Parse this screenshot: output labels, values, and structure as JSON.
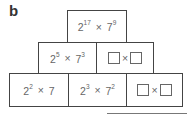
{
  "label": "b",
  "pyramid": {
    "top": {
      "base1": "2",
      "exp1": "17",
      "op": "×",
      "base2": "7",
      "exp2": "9"
    },
    "middle": [
      {
        "base1": "2",
        "exp1": "5",
        "op": "×",
        "base2": "7",
        "exp2": "3"
      },
      {
        "blank": true,
        "op": "×"
      }
    ],
    "bottom": [
      {
        "base1": "2",
        "exp1": "2",
        "op": "×",
        "base2": "7",
        "exp2": ""
      },
      {
        "base1": "2",
        "exp1": "3",
        "op": "×",
        "base2": "7",
        "exp2": "2"
      },
      {
        "blank": true,
        "op": "×"
      }
    ]
  }
}
